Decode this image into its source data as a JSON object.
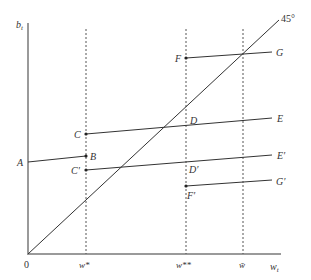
{
  "axes": {
    "y_label": "b",
    "y_sub": "t",
    "x_label": "w",
    "x_sub": "t",
    "origin_label": "0",
    "diagonal_label": "45°"
  },
  "x_ticks": [
    {
      "id": "w-star",
      "label": "w*",
      "x": 86
    },
    {
      "id": "w-double-star",
      "label": "w**",
      "x": 186
    },
    {
      "id": "w-bar",
      "label": "w̄",
      "x": 243
    }
  ],
  "points": {
    "A": "A",
    "B": "B",
    "C": "C",
    "D": "D",
    "E": "E",
    "F": "F",
    "G": "G",
    "C_prime": "C′",
    "D_prime": "D′",
    "E_prime": "E′",
    "F_prime": "F′",
    "G_prime": "G′"
  },
  "segments": [
    {
      "name": "AB",
      "from": [
        28,
        162
      ],
      "to": [
        86,
        156
      ]
    },
    {
      "name": "CE",
      "from": [
        86,
        134
      ],
      "to": [
        272,
        118
      ]
    },
    {
      "name": "FG",
      "from": [
        186,
        58
      ],
      "to": [
        272,
        52
      ]
    },
    {
      "name": "C'E'",
      "from": [
        86,
        170
      ],
      "to": [
        272,
        155
      ]
    },
    {
      "name": "F'G'",
      "from": [
        186,
        186
      ],
      "to": [
        272,
        180
      ]
    }
  ],
  "colors": {
    "axis": "#9a9a9a",
    "line": "#333333",
    "dashed": "#555555"
  }
}
